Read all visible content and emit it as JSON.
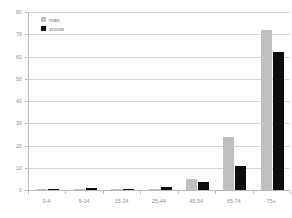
{
  "chart_data": {
    "type": "bar",
    "title": "",
    "xlabel": "",
    "ylabel": "",
    "ylim": [
      0,
      80
    ],
    "yticks": [
      0,
      10,
      20,
      30,
      40,
      50,
      60,
      70,
      80
    ],
    "grid": true,
    "legend_position": "top-left",
    "categories": [
      "0-4",
      "5-14",
      "15-24",
      "25-44",
      "45-54",
      "65-74",
      "75+"
    ],
    "series": [
      {
        "name": "man",
        "color": "#bfbfbf",
        "values": [
          0.6,
          0.5,
          0.1,
          0.6,
          5.0,
          24.0,
          72.0
        ]
      },
      {
        "name": "vrouw",
        "color": "#0d0d0d",
        "values": [
          0.4,
          0.8,
          0.1,
          1.3,
          3.6,
          11.0,
          62.0
        ]
      }
    ]
  },
  "legend": {
    "items": [
      {
        "label": "man"
      },
      {
        "label": "vrouw"
      }
    ]
  },
  "axis": {
    "y_tick_labels": [
      "0",
      "10",
      "20",
      "30",
      "40",
      "50",
      "60",
      "70",
      "80"
    ],
    "x_tick_labels": [
      "0-4",
      "5-14",
      "15-24",
      "25-44",
      "45-54",
      "65-74",
      "75+"
    ]
  },
  "colors": {
    "series_men": "#bfbfbf",
    "series_women": "#0d0d0d",
    "grid": "#d6d6d6",
    "axis": "#b9b9b9",
    "text": "#8a8a8a",
    "background": "#ffffff"
  }
}
